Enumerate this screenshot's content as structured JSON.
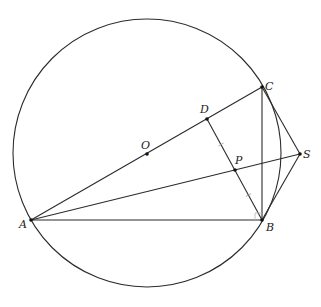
{
  "diagram": {
    "type": "geometry",
    "circle": {
      "center_label": "O",
      "cx": 147,
      "cy": 153,
      "r": 134
    },
    "points": [
      {
        "id": "A",
        "label": "A",
        "x": 31,
        "y": 220,
        "lx": 19,
        "ly": 228
      },
      {
        "id": "B",
        "label": "B",
        "x": 262,
        "y": 220,
        "lx": 266,
        "ly": 231
      },
      {
        "id": "C",
        "label": "C",
        "x": 262,
        "y": 87,
        "lx": 265,
        "ly": 90
      },
      {
        "id": "D",
        "label": "D",
        "x": 207,
        "y": 119,
        "lx": 200,
        "ly": 113
      },
      {
        "id": "O",
        "label": "O",
        "x": 147,
        "y": 154,
        "lx": 141,
        "ly": 149
      },
      {
        "id": "P",
        "label": "P",
        "x": 235,
        "y": 170,
        "lx": 235,
        "ly": 164
      },
      {
        "id": "S",
        "label": "S",
        "x": 300,
        "y": 154,
        "lx": 303,
        "ly": 158
      }
    ],
    "segments": [
      [
        "A",
        "C"
      ],
      [
        "A",
        "B"
      ],
      [
        "A",
        "S"
      ],
      [
        "B",
        "C"
      ],
      [
        "D",
        "B"
      ],
      [
        "C",
        "S"
      ],
      [
        "B",
        "S"
      ]
    ],
    "equal_marks": [
      [
        "D",
        "P"
      ],
      [
        "P",
        "B"
      ]
    ],
    "right_angle_at": "B"
  }
}
